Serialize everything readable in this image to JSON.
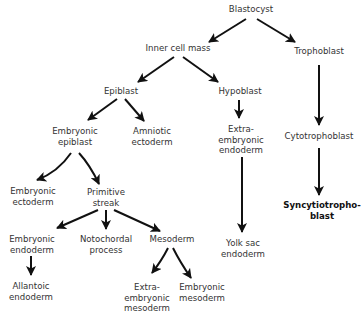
{
  "diagram": {
    "nodes": {
      "blastocyst": {
        "lines": [
          "Blastocyst"
        ]
      },
      "inner_cell_mass": {
        "lines": [
          "Inner cell mass"
        ]
      },
      "trophoblast": {
        "lines": [
          "Trophoblast"
        ]
      },
      "epiblast": {
        "lines": [
          "Epiblast"
        ]
      },
      "hypoblast": {
        "lines": [
          "Hypoblast"
        ]
      },
      "embryonic_epiblast": {
        "lines": [
          "Embryonic",
          "epiblast"
        ]
      },
      "amniotic_ectoderm": {
        "lines": [
          "Amniotic",
          "ectoderm"
        ]
      },
      "extraembryonic_endoderm": {
        "lines": [
          "Extra-",
          "embryonic",
          "endoderm"
        ]
      },
      "cytotrophoblast": {
        "lines": [
          "Cytotrophoblast"
        ]
      },
      "embryonic_ectoderm": {
        "lines": [
          "Embryonic",
          "ectoderm"
        ]
      },
      "primitive_streak": {
        "lines": [
          "Primitive",
          "streak"
        ]
      },
      "syncytiotrophoblast": {
        "lines": [
          "Syncytiotropho-",
          "blast"
        ]
      },
      "embryonic_endoderm": {
        "lines": [
          "Embryonic",
          "endoderm"
        ]
      },
      "notochordal_process": {
        "lines": [
          "Notochordal",
          "process"
        ]
      },
      "mesoderm": {
        "lines": [
          "Mesoderm"
        ]
      },
      "yolk_sac_endoderm": {
        "lines": [
          "Yolk sac",
          "endoderm"
        ]
      },
      "allantoic_endoderm": {
        "lines": [
          "Allantoic",
          "endoderm"
        ]
      },
      "extraembryonic_mesoderm": {
        "lines": [
          "Extra-",
          "embryonic",
          "mesoderm"
        ]
      },
      "embryonic_mesoderm": {
        "lines": [
          "Embryonic",
          "mesoderm"
        ]
      }
    },
    "edges": [
      [
        "blastocyst",
        "inner_cell_mass"
      ],
      [
        "blastocyst",
        "trophoblast"
      ],
      [
        "inner_cell_mass",
        "epiblast"
      ],
      [
        "inner_cell_mass",
        "hypoblast"
      ],
      [
        "epiblast",
        "embryonic_epiblast"
      ],
      [
        "epiblast",
        "amniotic_ectoderm"
      ],
      [
        "hypoblast",
        "extraembryonic_endoderm"
      ],
      [
        "trophoblast",
        "cytotrophoblast"
      ],
      [
        "embryonic_epiblast",
        "embryonic_ectoderm"
      ],
      [
        "embryonic_epiblast",
        "primitive_streak"
      ],
      [
        "cytotrophoblast",
        "syncytiotrophoblast"
      ],
      [
        "extraembryonic_endoderm",
        "yolk_sac_endoderm"
      ],
      [
        "primitive_streak",
        "embryonic_endoderm"
      ],
      [
        "primitive_streak",
        "notochordal_process"
      ],
      [
        "primitive_streak",
        "mesoderm"
      ],
      [
        "embryonic_endoderm",
        "allantoic_endoderm"
      ],
      [
        "mesoderm",
        "extraembryonic_mesoderm"
      ],
      [
        "mesoderm",
        "embryonic_mesoderm"
      ]
    ]
  }
}
